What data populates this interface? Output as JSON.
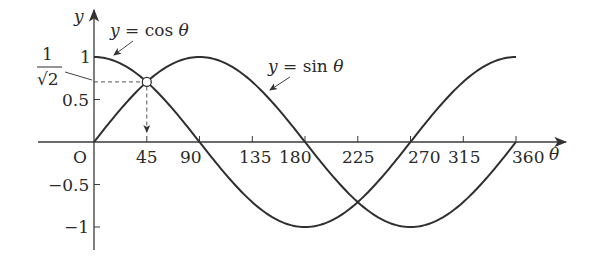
{
  "chart_data": {
    "type": "line",
    "title": "",
    "xlabel": "θ",
    "ylabel": "y",
    "origin_label": "O",
    "x_ticks": [
      45,
      90,
      135,
      180,
      225,
      270,
      315,
      360
    ],
    "x_tick_labels": [
      "45",
      "90",
      "135",
      "180",
      "225",
      "270",
      "315",
      "360"
    ],
    "y_ticks": [
      1,
      0.5,
      -0.5,
      -1
    ],
    "y_tick_labels": [
      "1",
      "0.5",
      "−0.5",
      "−1"
    ],
    "special_y_label": {
      "numerator": "1",
      "denominator": "√2",
      "value": 0.7071
    },
    "xlim": [
      0,
      360
    ],
    "ylim": [
      -1,
      1
    ],
    "grid": false,
    "x": [
      0,
      45,
      90,
      135,
      180,
      225,
      270,
      315,
      360
    ],
    "series": [
      {
        "name": "y = cos θ",
        "values": [
          1,
          0.707,
          0,
          -0.707,
          -1,
          -0.707,
          0,
          0.707,
          1
        ]
      },
      {
        "name": "y = sin θ",
        "values": [
          0,
          0.707,
          1,
          0.707,
          0,
          -0.707,
          -1,
          -0.707,
          0
        ]
      }
    ],
    "annotations": [
      {
        "text": "y = cos θ",
        "points_to": "cos curve near θ=15"
      },
      {
        "text": "y = sin θ",
        "points_to": "sin curve near θ=150"
      },
      {
        "text": "intersection",
        "at": [
          45,
          0.7071
        ],
        "marker": "open circle",
        "dashed_guides": true
      }
    ]
  },
  "labels": {
    "y_axis": "y",
    "x_axis": "θ",
    "origin": "O",
    "cos_eq_y": "y",
    "cos_eq_rest": " = cos ",
    "cos_eq_theta": "θ",
    "sin_eq_y": "y",
    "sin_eq_rest": " = sin ",
    "sin_eq_theta": "θ",
    "frac_num": "1",
    "frac_den": "√2",
    "t45": "45",
    "t90": "90",
    "t135": "135",
    "t180": "180",
    "t225": "225",
    "t270": "270",
    "t315": "315",
    "t360": "360",
    "y1": "1",
    "y05": "0.5",
    "yn05": "−0.5",
    "yn1": "−1"
  }
}
